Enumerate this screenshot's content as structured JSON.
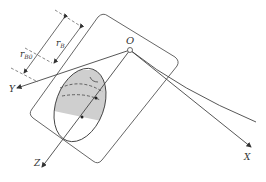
{
  "diagram": {
    "labels": {
      "origin": "O",
      "x_axis": "X",
      "y_axis": "Y",
      "z_axis": "Z",
      "r_b0": "r",
      "r_b0_sub": "B0",
      "r_b": "r",
      "r_b_sub": "B"
    },
    "colors": {
      "line": "#555555",
      "fill_shaded": "#cfcfcf",
      "background": "#ffffff"
    }
  }
}
